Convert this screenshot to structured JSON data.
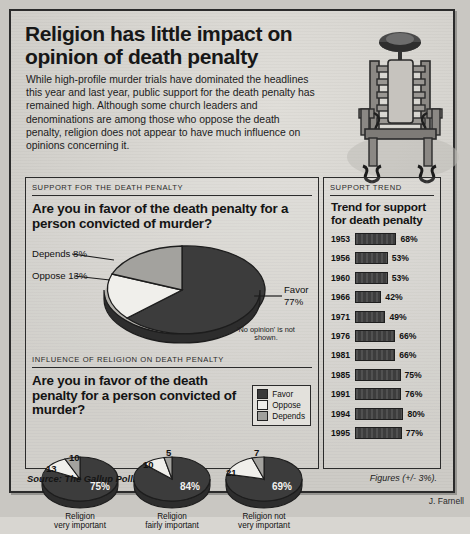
{
  "headline": "Religion has little impact on opinion of death penalty",
  "blurb": "While high-profile murder trials have dominated the headlines this year and last year, public support for the death penalty has remained high. Although some church leaders and denominations are among those who oppose the death penalty, religion does not appear to have much influence on opinions concerning it.",
  "illustration": {
    "name": "electric-chair"
  },
  "panel_support": {
    "kicker": "SUPPORT FOR THE DEATH PENALTY",
    "question": "Are you in favor of the death penalty for a person convicted of murder?",
    "note": "'No opinion' is not shown.",
    "labels": {
      "depends": "Depends 8%",
      "oppose": "Oppose 13%",
      "favor_name": "Favor",
      "favor_value": "77%"
    }
  },
  "panel_influence": {
    "kicker": "INFLUENCE OF RELIGION ON DEATH PENALTY",
    "question": "Are you in favor of the death penalty for a person convicted of murder?",
    "legend": [
      {
        "label": "Favor",
        "color": "#3a3a3a"
      },
      {
        "label": "Oppose",
        "color": "#efeeea"
      },
      {
        "label": "Depends",
        "color": "#a0a09c"
      }
    ]
  },
  "panel_trend": {
    "kicker": "SUPPORT TREND",
    "title": "Trend for support for death penalty"
  },
  "footer": {
    "source": "Source: The Gallup Poll.",
    "figures": "Figures (+/- 3%).",
    "credit": "J. Farnell"
  },
  "chart_data": [
    {
      "type": "pie",
      "title": "Are you in favor of the death penalty for a person convicted of murder?",
      "categories": [
        "Favor",
        "Oppose",
        "Depends"
      ],
      "values": [
        77,
        13,
        8
      ],
      "labels": [
        "Favor 77%",
        "Oppose 13%",
        "Depends 8%"
      ],
      "annotations": [
        "'No opinion' is not shown."
      ],
      "legend": "callout-labels"
    },
    {
      "type": "pie",
      "title": "Religion very important",
      "categories": [
        "Favor",
        "Oppose",
        "Depends"
      ],
      "values": [
        75,
        13,
        10
      ],
      "labels": [
        "75%",
        "13",
        "10"
      ],
      "caption_line1": "Religion",
      "caption_line2": "very important"
    },
    {
      "type": "pie",
      "title": "Religion fairly important",
      "categories": [
        "Favor",
        "Oppose",
        "Depends"
      ],
      "values": [
        84,
        10,
        5
      ],
      "labels": [
        "84%",
        "10",
        "5"
      ],
      "caption_line1": "Religion",
      "caption_line2": "fairly important"
    },
    {
      "type": "pie",
      "title": "Religion not very important",
      "categories": [
        "Favor",
        "Oppose",
        "Depends"
      ],
      "values": [
        69,
        21,
        7
      ],
      "labels": [
        "69%",
        "21",
        "7"
      ],
      "caption_line1": "Religion not",
      "caption_line2": "very important"
    },
    {
      "type": "bar",
      "title": "Trend for support for death penalty",
      "orientation": "horizontal",
      "categories": [
        "1953",
        "1956",
        "1960",
        "1966",
        "1971",
        "1976",
        "1981",
        "1985",
        "1991",
        "1994",
        "1995"
      ],
      "values": [
        68,
        53,
        53,
        42,
        49,
        66,
        66,
        75,
        76,
        80,
        77
      ],
      "value_labels": [
        "68%",
        "53%",
        "53%",
        "42%",
        "49%",
        "66%",
        "66%",
        "75%",
        "76%",
        "80%",
        "77%"
      ],
      "xlabel": "",
      "ylabel": "",
      "xlim": [
        0,
        100
      ],
      "grid": false,
      "legend": "none"
    }
  ]
}
